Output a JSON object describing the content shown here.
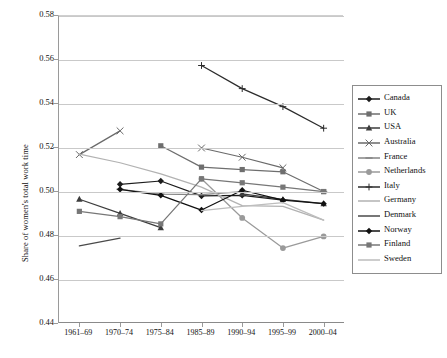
{
  "chart_data": {
    "type": "line",
    "title": "",
    "xlabel": "",
    "ylabel": "Share of women's total work time",
    "categories": [
      "1961–69",
      "1970–74",
      "1975–84",
      "1985–89",
      "1990–94",
      "1995–99",
      "2000–04"
    ],
    "ylim": [
      0.44,
      0.58
    ],
    "yticks": [
      "0.44",
      "0.46",
      "0.48",
      "0.50",
      "0.52",
      "0.54",
      "0.56",
      "0.58"
    ],
    "ytick_values": [
      0.44,
      0.46,
      0.48,
      0.5,
      0.52,
      0.54,
      0.56,
      0.58
    ],
    "grid": "horizontal",
    "legend_position": "right",
    "series": [
      {
        "name": "Canada",
        "marker": "diamond",
        "color": "#1c1c1c",
        "values": [
          null,
          0.5035,
          0.505,
          0.4982,
          0.4985,
          0.4963,
          null
        ]
      },
      {
        "name": "UK",
        "marker": "square",
        "color": "#6e6e6e",
        "values": [
          null,
          null,
          0.521,
          0.5113,
          0.5102,
          0.5092,
          0.5002
        ]
      },
      {
        "name": "USA",
        "marker": "triangle",
        "color": "#3d3d3d",
        "values": [
          0.4967,
          0.4903,
          0.4838,
          null,
          0.4992,
          0.4966,
          0.4947
        ]
      },
      {
        "name": "Australia",
        "marker": "x",
        "color": "#6a6a6a",
        "values": [
          0.517,
          0.5278,
          null,
          0.52,
          0.5158,
          0.511,
          null
        ]
      },
      {
        "name": "France",
        "marker": "dash",
        "color": "#858585",
        "values": [
          null,
          0.5012,
          0.499,
          0.4988,
          0.5002,
          null,
          0.5002
        ]
      },
      {
        "name": "Netherlands",
        "marker": "circle",
        "color": "#9a9a9a",
        "values": [
          null,
          null,
          null,
          0.506,
          0.4882,
          0.4745,
          0.4798
        ]
      },
      {
        "name": "Italy",
        "marker": "plus",
        "color": "#2c2c2c",
        "values": [
          null,
          null,
          null,
          0.5575,
          0.547,
          0.5388,
          0.529
        ]
      },
      {
        "name": "Germany",
        "marker": "line",
        "color": "#b2b2b2",
        "values": [
          0.5172,
          0.5133,
          0.5082,
          0.5022,
          0.4938,
          0.4935,
          0.4872
        ]
      },
      {
        "name": "Denmark",
        "marker": "line",
        "color": "#4a4a4a",
        "values": [
          0.4755,
          0.479,
          null,
          0.4857,
          null,
          null,
          null
        ]
      },
      {
        "name": "Norway",
        "marker": "diamond",
        "color": "#111111",
        "values": [
          null,
          0.5012,
          0.4985,
          0.4918,
          0.5008,
          0.4963,
          0.4947
        ]
      },
      {
        "name": "Finland",
        "marker": "square",
        "color": "#777777",
        "values": [
          0.4912,
          0.4888,
          0.4855,
          0.506,
          0.5042,
          0.5022,
          0.5002
        ]
      },
      {
        "name": "Sweden",
        "marker": "line",
        "color": "#bdbdbd",
        "values": [
          null,
          null,
          null,
          0.4915,
          0.4935,
          0.4952,
          0.4872
        ]
      }
    ]
  },
  "legend": {
    "items": [
      {
        "label": "Canada"
      },
      {
        "label": "UK"
      },
      {
        "label": "USA"
      },
      {
        "label": "Australia"
      },
      {
        "label": "France"
      },
      {
        "label": "Netherlands"
      },
      {
        "label": "Italy"
      },
      {
        "label": "Germany"
      },
      {
        "label": "Denmark"
      },
      {
        "label": "Norway"
      },
      {
        "label": "Finland"
      },
      {
        "label": "Sweden"
      }
    ]
  }
}
